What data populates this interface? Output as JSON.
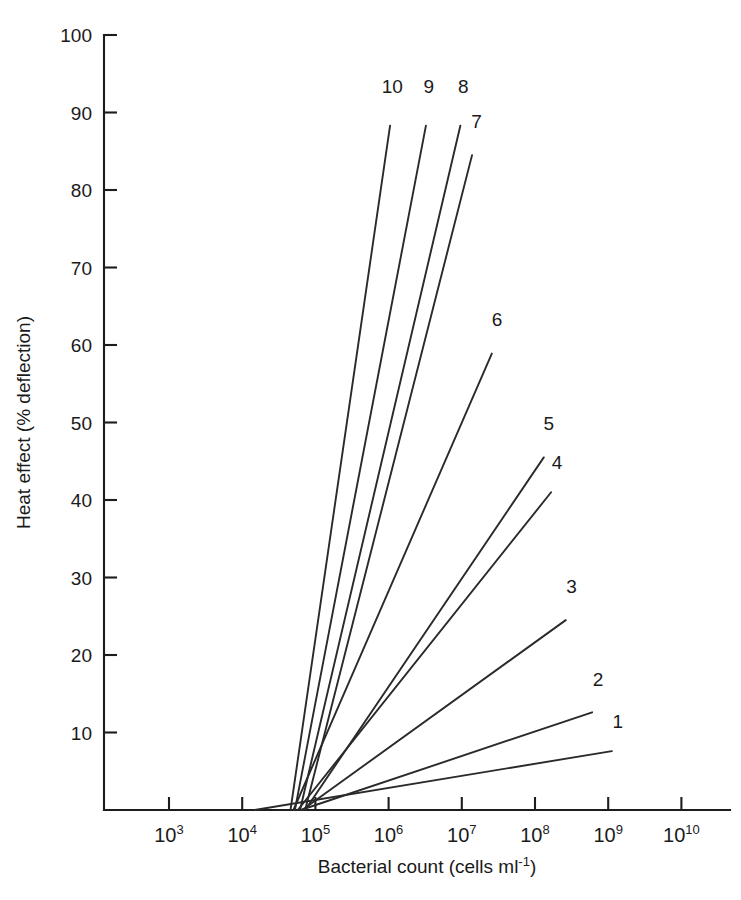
{
  "chart_data": {
    "type": "line",
    "title": "",
    "subtitle": "",
    "xlabel": "Bacterial count (cells ml⁻¹)",
    "ylabel": "Heat effect (% deflection)",
    "xscale": "log",
    "yscale": "linear",
    "xlim": [
      2.3,
      10.5
    ],
    "ylim": [
      0,
      100
    ],
    "grid": false,
    "legend_position": "inline-end-of-line",
    "x_tick_labels": [
      "10³",
      "10⁴",
      "10⁵",
      "10⁶",
      "10⁷",
      "10⁸",
      "10⁹",
      "10¹⁰"
    ],
    "x_tick_bases": [
      "10",
      "10",
      "10",
      "10",
      "10",
      "10",
      "10",
      "10"
    ],
    "x_tick_exponents": [
      "3",
      "4",
      "5",
      "6",
      "7",
      "8",
      "9",
      "10"
    ],
    "x_tick_log_values": [
      3,
      4,
      5,
      6,
      7,
      8,
      9,
      10
    ],
    "y_tick_labels": [
      "0",
      "10",
      "20",
      "30",
      "40",
      "50",
      "60",
      "70",
      "80",
      "90",
      "100"
    ],
    "y_tick_values": [
      0,
      10,
      20,
      30,
      40,
      50,
      60,
      70,
      80,
      90,
      100
    ],
    "y_axis_label_shown": [
      "10",
      "20",
      "30",
      "40",
      "50",
      "60",
      "70",
      "80",
      "90",
      "100"
    ],
    "series": [
      {
        "name": "1",
        "label": "1",
        "points": [
          [
            4.17,
            0
          ],
          [
            9.05,
            7.6
          ]
        ]
      },
      {
        "name": "2",
        "label": "2",
        "points": [
          [
            4.8,
            0
          ],
          [
            8.78,
            12.6
          ]
        ]
      },
      {
        "name": "3",
        "label": "3",
        "points": [
          [
            4.82,
            0
          ],
          [
            8.42,
            24.5
          ]
        ]
      },
      {
        "name": "4",
        "label": "4",
        "points": [
          [
            4.76,
            0
          ],
          [
            8.22,
            41.0
          ]
        ]
      },
      {
        "name": "5",
        "label": "5",
        "points": [
          [
            4.86,
            0
          ],
          [
            8.12,
            45.5
          ]
        ]
      },
      {
        "name": "6",
        "label": "6",
        "points": [
          [
            4.7,
            0
          ],
          [
            7.41,
            58.9
          ]
        ]
      },
      {
        "name": "7",
        "label": "7",
        "points": [
          [
            4.86,
            0
          ],
          [
            7.14,
            84.5
          ]
        ]
      },
      {
        "name": "8",
        "label": "8",
        "points": [
          [
            4.79,
            0
          ],
          [
            6.98,
            88.3
          ]
        ]
      },
      {
        "name": "9",
        "label": "9",
        "points": [
          [
            4.72,
            0
          ],
          [
            6.51,
            88.3
          ]
        ]
      },
      {
        "name": "10",
        "label": "10",
        "points": [
          [
            4.66,
            0
          ],
          [
            6.02,
            88.3
          ]
        ]
      }
    ],
    "series_label_positions": [
      {
        "name": "10",
        "x_log": 6.05,
        "y": 92.5
      },
      {
        "name": "9",
        "x_log": 6.55,
        "y": 92.5
      },
      {
        "name": "8",
        "x_log": 7.02,
        "y": 92.5
      },
      {
        "name": "7",
        "x_log": 7.2,
        "y": 88.0
      },
      {
        "name": "6",
        "x_log": 7.48,
        "y": 62.5
      },
      {
        "name": "5",
        "x_log": 8.19,
        "y": 49.0
      },
      {
        "name": "4",
        "x_log": 8.3,
        "y": 44.0
      },
      {
        "name": "3",
        "x_log": 8.5,
        "y": 28.0
      },
      {
        "name": "2",
        "x_log": 8.86,
        "y": 16.0
      },
      {
        "name": "1",
        "x_log": 9.13,
        "y": 10.6
      }
    ],
    "colors": {
      "line": "#2a2a2a",
      "axis": "#1d1d1d",
      "text": "#1a1a1a",
      "background": "#ffffff"
    }
  }
}
